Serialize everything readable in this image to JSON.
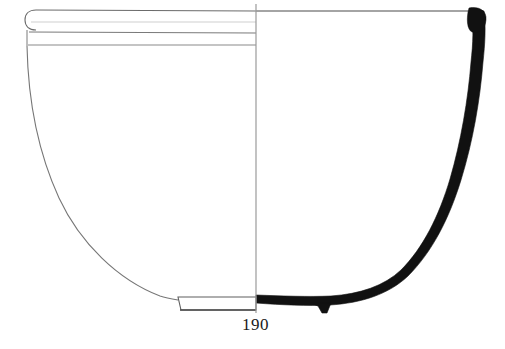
{
  "figure": {
    "kind": "archaeological-pottery-profile-drawing",
    "object_type": "hemispherical bowl",
    "catalog_number": "190",
    "background_color": "#ffffff",
    "ink_color": "#1a1a1a",
    "section_fill_color": "#111111",
    "outline_color": "#5a5a5a",
    "axis_color": "#8d8d8d",
    "view": {
      "left_half_label": "exterior elevation",
      "right_half_label": "section",
      "axis_x": 256
    },
    "geometry": {
      "rim_top_y": 11,
      "rim_left_x": 27,
      "rim_right_x": 484,
      "base_y": 310,
      "foot_ring_left_x": 178,
      "foot_ring_right_x": 256,
      "foot_ring_top_y": 296,
      "max_width_px": 457,
      "total_height_px": 299
    },
    "rim_bands": [
      {
        "name": "rim-top-line",
        "y": 11
      },
      {
        "name": "rim-inner-line",
        "y": 22
      },
      {
        "name": "band-line-upper",
        "y": 33
      },
      {
        "name": "band-line-lower",
        "y": 45
      }
    ],
    "features": [
      {
        "name": "rounded-rim-edge",
        "side": "left"
      },
      {
        "name": "rim-band-zone",
        "side": "left"
      },
      {
        "name": "curving-body-wall",
        "side": "left"
      },
      {
        "name": "solid-section-wall",
        "side": "right"
      },
      {
        "name": "foot-spur",
        "side": "right"
      },
      {
        "name": "foot-ring",
        "side": "left"
      }
    ]
  }
}
